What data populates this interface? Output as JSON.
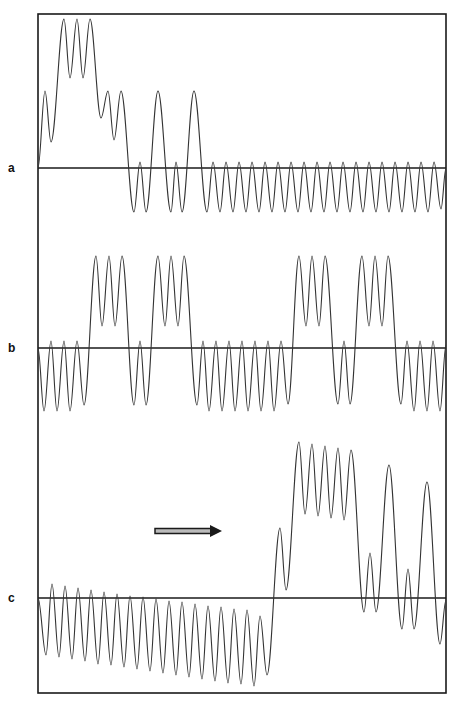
{
  "figure": {
    "frame": {
      "x1": 38,
      "y1": 14,
      "x2": 446,
      "y2": 693,
      "color": "#1a1a1a"
    },
    "arrow": {
      "x1": 155,
      "x2": 222,
      "y": 531,
      "color": "#1a1a1a"
    },
    "panels": [
      {
        "label": "a",
        "label_pos": {
          "x": 8,
          "y": 161
        },
        "baseline_y": 168,
        "extrema": [
          [
            38,
            168
          ],
          [
            45,
            91
          ],
          [
            51,
            142
          ],
          [
            64,
            19
          ],
          [
            70,
            78
          ],
          [
            77,
            19
          ],
          [
            83,
            78
          ],
          [
            90,
            19
          ],
          [
            101,
            118
          ],
          [
            108,
            91
          ],
          [
            114,
            140
          ],
          [
            121,
            91
          ],
          [
            134,
            212
          ],
          [
            140,
            162
          ],
          [
            146,
            212
          ],
          [
            158,
            91
          ],
          [
            171,
            212
          ],
          [
            176,
            162
          ],
          [
            182,
            212
          ],
          [
            194,
            91
          ],
          [
            207,
            212
          ],
          [
            213,
            162
          ],
          [
            220,
            212
          ],
          [
            226,
            162
          ],
          [
            233,
            212
          ],
          [
            239,
            162
          ],
          [
            246,
            212
          ],
          [
            252,
            162
          ],
          [
            259,
            212
          ],
          [
            265,
            162
          ],
          [
            272,
            212
          ],
          [
            278,
            162
          ],
          [
            285,
            212
          ],
          [
            291,
            162
          ],
          [
            298,
            212
          ],
          [
            304,
            162
          ],
          [
            311,
            212
          ],
          [
            317,
            162
          ],
          [
            324,
            212
          ],
          [
            330,
            162
          ],
          [
            337,
            212
          ],
          [
            343,
            162
          ],
          [
            350,
            212
          ],
          [
            356,
            162
          ],
          [
            363,
            212
          ],
          [
            369,
            162
          ],
          [
            376,
            212
          ],
          [
            382,
            162
          ],
          [
            389,
            212
          ],
          [
            395,
            162
          ],
          [
            402,
            212
          ],
          [
            408,
            162
          ],
          [
            415,
            212
          ],
          [
            421,
            162
          ],
          [
            428,
            212
          ],
          [
            434,
            162
          ],
          [
            441,
            209
          ],
          [
            446,
            168
          ]
        ]
      },
      {
        "label": "b",
        "label_pos": {
          "x": 8,
          "y": 341
        },
        "baseline_y": 348,
        "extrema": [
          [
            38,
            348
          ],
          [
            44,
            411
          ],
          [
            51,
            341
          ],
          [
            57,
            411
          ],
          [
            64,
            341
          ],
          [
            70,
            411
          ],
          [
            77,
            341
          ],
          [
            84,
            405
          ],
          [
            96,
            256
          ],
          [
            102,
            326
          ],
          [
            109,
            256
          ],
          [
            115,
            326
          ],
          [
            122,
            256
          ],
          [
            134,
            405
          ],
          [
            140,
            341
          ],
          [
            146,
            405
          ],
          [
            158,
            256
          ],
          [
            165,
            326
          ],
          [
            171,
            256
          ],
          [
            178,
            326
          ],
          [
            184,
            256
          ],
          [
            197,
            405
          ],
          [
            203,
            341
          ],
          [
            209,
            411
          ],
          [
            216,
            341
          ],
          [
            222,
            411
          ],
          [
            229,
            341
          ],
          [
            235,
            411
          ],
          [
            242,
            341
          ],
          [
            248,
            411
          ],
          [
            255,
            341
          ],
          [
            261,
            411
          ],
          [
            268,
            341
          ],
          [
            274,
            411
          ],
          [
            281,
            341
          ],
          [
            288,
            404
          ],
          [
            299,
            256
          ],
          [
            306,
            326
          ],
          [
            312,
            256
          ],
          [
            319,
            326
          ],
          [
            325,
            256
          ],
          [
            338,
            404
          ],
          [
            344,
            341
          ],
          [
            350,
            404
          ],
          [
            362,
            256
          ],
          [
            369,
            326
          ],
          [
            375,
            256
          ],
          [
            382,
            326
          ],
          [
            388,
            256
          ],
          [
            401,
            404
          ],
          [
            407,
            341
          ],
          [
            414,
            411
          ],
          [
            420,
            341
          ],
          [
            427,
            411
          ],
          [
            433,
            341
          ],
          [
            440,
            411
          ],
          [
            446,
            345
          ]
        ]
      },
      {
        "label": "c",
        "label_pos": {
          "x": 8,
          "y": 591
        },
        "baseline_y": 598,
        "extrema": [
          [
            38,
            598
          ],
          [
            46,
            655
          ],
          [
            52,
            584
          ],
          [
            59,
            657
          ],
          [
            65,
            586
          ],
          [
            72,
            659
          ],
          [
            78,
            588
          ],
          [
            85,
            661
          ],
          [
            91,
            590
          ],
          [
            98,
            664
          ],
          [
            104,
            592
          ],
          [
            111,
            665
          ],
          [
            117,
            594
          ],
          [
            124,
            667
          ],
          [
            130,
            596
          ],
          [
            137,
            669
          ],
          [
            143,
            597
          ],
          [
            150,
            671
          ],
          [
            156,
            599
          ],
          [
            163,
            673
          ],
          [
            169,
            601
          ],
          [
            176,
            675
          ],
          [
            182,
            602
          ],
          [
            189,
            677
          ],
          [
            195,
            604
          ],
          [
            202,
            679
          ],
          [
            208,
            606
          ],
          [
            215,
            681
          ],
          [
            221,
            607
          ],
          [
            228,
            683
          ],
          [
            234,
            609
          ],
          [
            241,
            684
          ],
          [
            247,
            610
          ],
          [
            254,
            686
          ],
          [
            260,
            616
          ],
          [
            267,
            675
          ],
          [
            280,
            528
          ],
          [
            286,
            590
          ],
          [
            299,
            442
          ],
          [
            305,
            514
          ],
          [
            312,
            444
          ],
          [
            318,
            516
          ],
          [
            325,
            446
          ],
          [
            331,
            518
          ],
          [
            338,
            448
          ],
          [
            344,
            520
          ],
          [
            351,
            450
          ],
          [
            364,
            612
          ],
          [
            370,
            553
          ],
          [
            376,
            612
          ],
          [
            389,
            465
          ],
          [
            402,
            629
          ],
          [
            408,
            569
          ],
          [
            414,
            629
          ],
          [
            427,
            482
          ],
          [
            440,
            644
          ],
          [
            446,
            600
          ]
        ]
      }
    ]
  }
}
